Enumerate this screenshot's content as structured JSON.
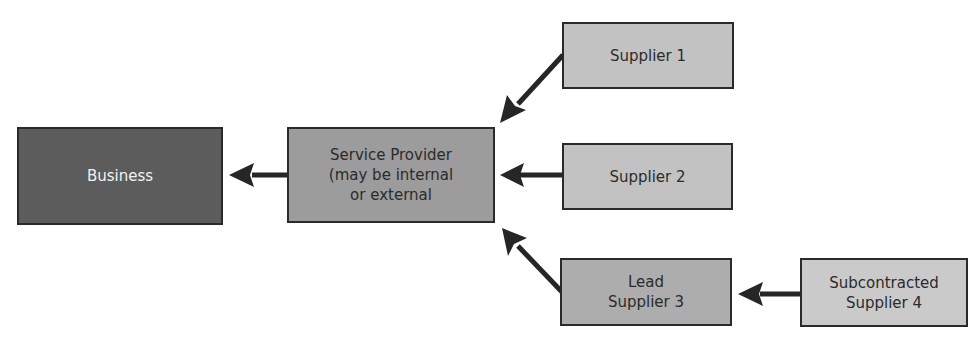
{
  "diagram": {
    "type": "flow",
    "direction": "right-to-left",
    "nodes": [
      {
        "id": "business",
        "label": "Business",
        "fill": "#5c5c5c",
        "text_color": "#f2f2f2"
      },
      {
        "id": "provider",
        "label": "Service Provider\n(may be internal\nor external",
        "fill": "#9c9c9c",
        "text_color": "#2b2b2b"
      },
      {
        "id": "supplier1",
        "label": "Supplier 1",
        "fill": "#c2c2c2",
        "text_color": "#2b2b2b"
      },
      {
        "id": "supplier2",
        "label": "Supplier 2",
        "fill": "#c2c2c2",
        "text_color": "#2b2b2b"
      },
      {
        "id": "supplier3",
        "label": "Lead\nSupplier 3",
        "fill": "#adadad",
        "text_color": "#2b2b2b"
      },
      {
        "id": "supplier4",
        "label": "Subcontracted\nSupplier 4",
        "fill": "#cacaca",
        "text_color": "#2b2b2b"
      }
    ],
    "edges": [
      {
        "from": "provider",
        "to": "business"
      },
      {
        "from": "supplier1",
        "to": "provider"
      },
      {
        "from": "supplier2",
        "to": "provider"
      },
      {
        "from": "supplier3",
        "to": "provider"
      },
      {
        "from": "supplier4",
        "to": "supplier3"
      }
    ],
    "edge_color": "#262626"
  }
}
